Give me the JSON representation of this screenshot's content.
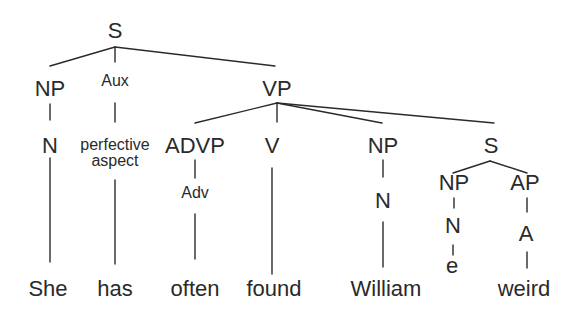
{
  "diagram": {
    "type": "syntax-tree",
    "sentence": [
      "She",
      "has",
      "often",
      "found",
      "William",
      "weird"
    ],
    "nodes": [
      {
        "id": "S",
        "label": "S",
        "x": 115,
        "y": 38,
        "size": "big"
      },
      {
        "id": "NP1",
        "label": "NP",
        "x": 50,
        "y": 96,
        "size": "big"
      },
      {
        "id": "Aux",
        "label": "Aux",
        "x": 115,
        "y": 86,
        "size": "small"
      },
      {
        "id": "VP",
        "label": "VP",
        "x": 277,
        "y": 96,
        "size": "big"
      },
      {
        "id": "N1",
        "label": "N",
        "x": 50,
        "y": 153,
        "size": "big"
      },
      {
        "id": "Aux1",
        "label": "perfective",
        "x": 115,
        "y": 150,
        "size": "small"
      },
      {
        "id": "Aux2",
        "label": "aspect",
        "x": 115,
        "y": 166,
        "size": "small"
      },
      {
        "id": "ADVP",
        "label": "ADVP",
        "x": 195,
        "y": 153,
        "size": "big"
      },
      {
        "id": "V",
        "label": "V",
        "x": 272,
        "y": 153,
        "size": "big"
      },
      {
        "id": "NP2",
        "label": "NP",
        "x": 383,
        "y": 153,
        "size": "big"
      },
      {
        "id": "S2",
        "label": "S",
        "x": 491,
        "y": 153,
        "size": "big"
      },
      {
        "id": "Adv",
        "label": "Adv",
        "x": 195,
        "y": 198,
        "size": "small"
      },
      {
        "id": "N2",
        "label": "N",
        "x": 383,
        "y": 208,
        "size": "big"
      },
      {
        "id": "NP3",
        "label": "NP",
        "x": 454,
        "y": 190,
        "size": "big"
      },
      {
        "id": "AP",
        "label": "AP",
        "x": 525,
        "y": 190,
        "size": "big"
      },
      {
        "id": "N3",
        "label": "N",
        "x": 453,
        "y": 233,
        "size": "big"
      },
      {
        "id": "A",
        "label": "A",
        "x": 526,
        "y": 241,
        "size": "big"
      },
      {
        "id": "e",
        "label": "e",
        "x": 452,
        "y": 273,
        "size": "big"
      },
      {
        "id": "w1",
        "label": "She",
        "x": 48,
        "y": 296,
        "size": "word"
      },
      {
        "id": "w2",
        "label": "has",
        "x": 115,
        "y": 296,
        "size": "word"
      },
      {
        "id": "w3",
        "label": "often",
        "x": 195,
        "y": 296,
        "size": "word"
      },
      {
        "id": "w4",
        "label": "found",
        "x": 274,
        "y": 296,
        "size": "word"
      },
      {
        "id": "w5",
        "label": "William",
        "x": 386,
        "y": 296,
        "size": "word"
      },
      {
        "id": "w6",
        "label": "weird",
        "x": 524,
        "y": 296,
        "size": "word"
      }
    ],
    "edges": [
      {
        "from": "S",
        "to": "NP1",
        "x1": 115,
        "y1": 47,
        "x2": 50,
        "y2": 66
      },
      {
        "from": "S",
        "to": "Aux",
        "x1": 115,
        "y1": 47,
        "x2": 115,
        "y2": 62
      },
      {
        "from": "S",
        "to": "VP",
        "x1": 115,
        "y1": 47,
        "x2": 275,
        "y2": 66
      },
      {
        "from": "NP1",
        "to": "N1",
        "x1": 50,
        "y1": 104,
        "x2": 50,
        "y2": 120
      },
      {
        "from": "Aux",
        "to": "Aux1",
        "x1": 115,
        "y1": 103,
        "x2": 115,
        "y2": 122
      },
      {
        "from": "VP",
        "to": "ADVP",
        "x1": 277,
        "y1": 103,
        "x2": 195,
        "y2": 123
      },
      {
        "from": "VP",
        "to": "V",
        "x1": 277,
        "y1": 103,
        "x2": 277,
        "y2": 122
      },
      {
        "from": "VP",
        "to": "NP2",
        "x1": 277,
        "y1": 103,
        "x2": 382,
        "y2": 123
      },
      {
        "from": "VP",
        "to": "S2",
        "x1": 277,
        "y1": 103,
        "x2": 494,
        "y2": 123
      },
      {
        "from": "ADVP",
        "to": "Adv",
        "x1": 195,
        "y1": 160,
        "x2": 195,
        "y2": 178
      },
      {
        "from": "NP2",
        "to": "N2",
        "x1": 383,
        "y1": 160,
        "x2": 383,
        "y2": 177
      },
      {
        "from": "S2",
        "to": "NP3",
        "x1": 490,
        "y1": 161,
        "x2": 453,
        "y2": 173
      },
      {
        "from": "S2",
        "to": "AP",
        "x1": 490,
        "y1": 161,
        "x2": 527,
        "y2": 173
      },
      {
        "from": "NP3",
        "to": "N3",
        "x1": 454,
        "y1": 198,
        "x2": 454,
        "y2": 208
      },
      {
        "from": "AP",
        "to": "A",
        "x1": 527,
        "y1": 198,
        "x2": 527,
        "y2": 212
      },
      {
        "from": "N3",
        "to": "e",
        "x1": 453,
        "y1": 245,
        "x2": 453,
        "y2": 255
      },
      {
        "from": "N1",
        "to": "w1",
        "x1": 50,
        "y1": 158,
        "x2": 50,
        "y2": 262
      },
      {
        "from": "Aux2",
        "to": "w2",
        "x1": 115,
        "y1": 180,
        "x2": 115,
        "y2": 264
      },
      {
        "from": "Adv",
        "to": "w3",
        "x1": 195,
        "y1": 214,
        "x2": 195,
        "y2": 259
      },
      {
        "from": "V",
        "to": "w4",
        "x1": 272,
        "y1": 168,
        "x2": 272,
        "y2": 274
      },
      {
        "from": "N2",
        "to": "w5",
        "x1": 383,
        "y1": 222,
        "x2": 383,
        "y2": 267
      },
      {
        "from": "A",
        "to": "w6",
        "x1": 527,
        "y1": 252,
        "x2": 527,
        "y2": 268
      }
    ]
  }
}
